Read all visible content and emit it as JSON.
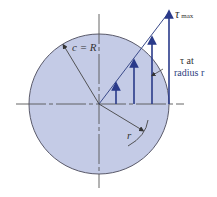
{
  "diagram": {
    "colors": {
      "disk_fill": "#c4cbe6",
      "disk_stroke": "#5a5a6a",
      "arrow": "#2a3a8a",
      "axis": "#555555",
      "background": "#ffffff"
    },
    "labels": {
      "radius_label": "c = R",
      "tau_max_symbol": "τ",
      "tau_max_sub": "max",
      "tau_at_line1": "τ at",
      "tau_at_line2": "radius r",
      "r_label": "r"
    },
    "geometry": {
      "center": [
        99,
        104
      ],
      "radius": 70,
      "stress_arrows_x": [
        116,
        134,
        152,
        169
      ],
      "stress_arrows_top_y": [
        86,
        63,
        40,
        14
      ]
    }
  }
}
